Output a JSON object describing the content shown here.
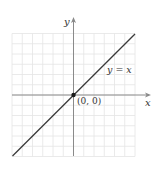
{
  "figure": {
    "type": "coordinate-plane",
    "x_axis_label": "x",
    "y_axis_label": "y",
    "line_label": "y = x",
    "point_label": "(0, 0)",
    "grid": {
      "cells_per_side": 6,
      "cell_px": 10.25
    },
    "colors": {
      "grid": "#e4e4e4",
      "axis": "#8a8a8a",
      "line": "#3a3a3a",
      "point": "#1a1a1a",
      "text": "#333333"
    }
  },
  "chart_data": {
    "type": "line",
    "title": "",
    "xlabel": "x",
    "ylabel": "y",
    "series": [
      {
        "name": "y = x",
        "x": [
          -6,
          6
        ],
        "y": [
          -6,
          6
        ]
      }
    ],
    "points": [
      {
        "label": "(0, 0)",
        "x": 0,
        "y": 0
      }
    ],
    "xlim": [
      -6,
      6
    ],
    "ylim": [
      -6,
      6
    ],
    "grid": true,
    "legend": "none"
  }
}
